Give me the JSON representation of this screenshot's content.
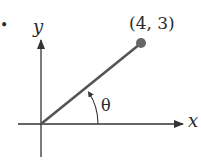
{
  "diagram": {
    "point_label": "(4, 3)",
    "point": {
      "x": 4,
      "y": 3
    },
    "x_axis_label": "x",
    "y_axis_label": "y",
    "angle_label": "θ",
    "bullet": "•",
    "colors": {
      "line": "#555555",
      "point": "#666666",
      "axis": "#333333",
      "text": "#2a2a2a"
    }
  }
}
